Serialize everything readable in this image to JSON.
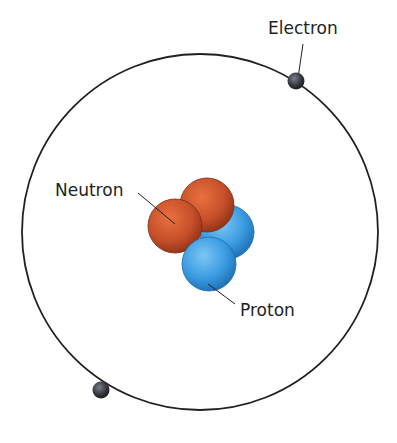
{
  "diagram": {
    "labels": {
      "electron": "Electron",
      "neutron": "Neutron",
      "proton": "Proton"
    },
    "colors": {
      "orbit": "#231f20",
      "electron": "#2b2d33",
      "neutron": "#c8502a",
      "proton": "#3a9be0"
    }
  }
}
